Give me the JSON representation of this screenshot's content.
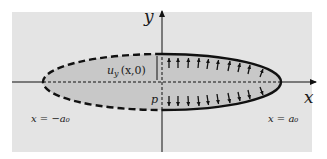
{
  "figure": {
    "background_color": "#e4e4e4",
    "fill_color": "#c8c8c8",
    "line_color": "#111111",
    "axes": {
      "x_label": "x",
      "y_label": "y"
    },
    "ellipse": {
      "left_half_style": "dashed",
      "right_half_style": "solid",
      "center_line_style": "dashed"
    },
    "labels": {
      "left_vertex": "x = −a₀",
      "right_vertex": "x = a₀",
      "displacement": "u",
      "displacement_sub": "y",
      "displacement_args": "(x,0)",
      "pressure": "p"
    },
    "arrows": {
      "upper_count": 12,
      "lower_count": 12,
      "direction_upper": "up",
      "direction_lower": "down"
    }
  }
}
